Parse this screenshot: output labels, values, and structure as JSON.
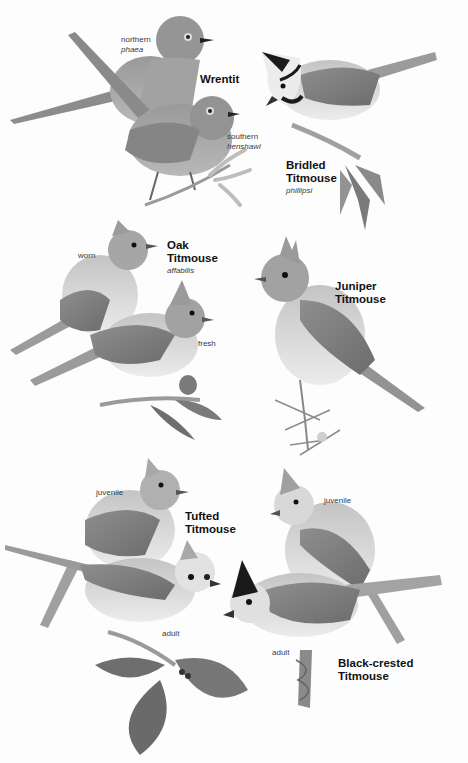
{
  "plate": {
    "background": "#fdfdfd",
    "tones": {
      "body_dark": "#8a8a8a",
      "body_mid": "#a9a9a9",
      "belly": "#dedede",
      "wing": "#7d7d7d",
      "black": "#1a1a1a",
      "branch": "#9a9a9a",
      "leaf": "#6e6e6e"
    }
  },
  "species": [
    {
      "id": "wrentit",
      "name_lines": [
        "Wrentit"
      ],
      "subspecies_labels": [
        {
          "line1": "northern",
          "line2": "phaea"
        },
        {
          "line1": "southern",
          "line2": "henshawi"
        }
      ]
    },
    {
      "id": "bridled-titmouse",
      "name_lines": [
        "Bridled",
        "Titmouse"
      ],
      "scientific": "phillipsi"
    },
    {
      "id": "oak-titmouse",
      "name_lines": [
        "Oak",
        "Titmouse"
      ],
      "scientific": "affabilis",
      "labels": [
        "worn",
        "fresh"
      ]
    },
    {
      "id": "juniper-titmouse",
      "name_lines": [
        "Juniper",
        "Titmouse"
      ]
    },
    {
      "id": "tufted-titmouse",
      "name_lines": [
        "Tufted",
        "Titmouse"
      ],
      "labels": [
        "juvenile",
        "adult"
      ]
    },
    {
      "id": "black-crested-titmouse",
      "name_lines": [
        "Black-crested",
        "Titmouse"
      ],
      "labels": [
        "juvenile",
        "adult"
      ]
    }
  ]
}
